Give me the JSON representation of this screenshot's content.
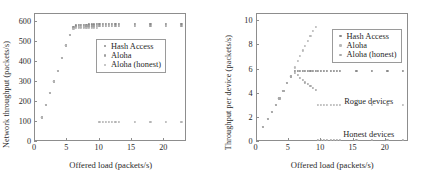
{
  "figure": {
    "panels": [
      {
        "id": "left",
        "xlabel": "Offered load (packets/s)",
        "ylabel": "Network throughput (packets/s)",
        "xticks": [
          "0",
          "5",
          "10",
          "15",
          "20"
        ],
        "yticks": [
          "0",
          "100",
          "200",
          "300",
          "400",
          "500",
          "600"
        ],
        "legend": [
          "Hash Access",
          "Aloha",
          "Aloha (honest)"
        ],
        "annotations": []
      },
      {
        "id": "right",
        "xlabel": "Offered load (packets/s)",
        "ylabel": "Throughput per device (packets/s)",
        "xticks": [
          "0",
          "5",
          "10",
          "15",
          "20"
        ],
        "yticks": [
          "0",
          "2",
          "4",
          "6",
          "8",
          "10"
        ],
        "legend": [
          "Hash Access",
          "Aloha",
          "Aloha (honest)"
        ],
        "annotations": [
          "Rogue devices",
          "Honest devices"
        ]
      }
    ]
  },
  "colors": {
    "hash_access": "#8a8a8a",
    "aloha": "#9e9e9e",
    "aloha_honest": "#b4b4b4",
    "axis": "#8d8d8d",
    "text": "#2a2a2a"
  },
  "chart_data": [
    {
      "type": "scatter",
      "id": "left",
      "title": "",
      "xlabel": "Offered load (packets/s)",
      "ylabel": "Network throughput (packets/s)",
      "xlim": [
        0,
        23.5
      ],
      "ylim": [
        0,
        640
      ],
      "xticks": [
        0,
        5,
        10,
        15,
        20
      ],
      "yticks": [
        0,
        100,
        200,
        300,
        400,
        500,
        600
      ],
      "grid": false,
      "legend_position": "center-right",
      "series": [
        {
          "name": "Hash Access",
          "marker": "dot",
          "color": "#8a8a8a",
          "x": [
            1.2,
            1.9,
            2.5,
            3.1,
            3.7,
            4.3,
            4.9,
            5.5,
            6.1,
            6.5,
            6.9,
            7.3,
            7.7,
            8.1,
            8.5,
            8.9,
            9.3,
            9.7,
            10.1,
            10.6,
            11.1,
            11.6,
            12.1,
            12.6,
            13.1,
            15.6,
            18.0,
            20.4,
            22.8
          ],
          "y": [
            118,
            182,
            240,
            298,
            352,
            415,
            478,
            532,
            572,
            578,
            580,
            581,
            582,
            582,
            583,
            583,
            583,
            584,
            584,
            584,
            584,
            585,
            585,
            585,
            585,
            585,
            585,
            585,
            585
          ]
        },
        {
          "name": "Aloha",
          "marker": "dot",
          "color": "#9e9e9e",
          "x": [
            1.2,
            1.9,
            2.5,
            3.1,
            3.7,
            4.3,
            4.9,
            5.5,
            6.1,
            6.5,
            6.9,
            7.3,
            7.7,
            8.1,
            8.5,
            8.9,
            9.3,
            9.7,
            10.1,
            10.6,
            11.1,
            11.6,
            12.1,
            12.6,
            13.1,
            15.6,
            18.0,
            20.4,
            22.8
          ],
          "y": [
            118,
            182,
            240,
            298,
            352,
            415,
            478,
            532,
            566,
            570,
            572,
            572,
            572,
            573,
            573,
            573,
            573,
            574,
            574,
            574,
            574,
            574,
            574,
            574,
            574,
            574,
            574,
            574,
            574
          ]
        },
        {
          "name": "Aloha (honest)",
          "marker": "dot",
          "color": "#b4b4b4",
          "x": [
            1.2,
            1.9,
            2.5,
            3.1,
            3.7,
            4.3,
            4.9,
            5.5,
            6.1,
            6.5,
            6.9,
            7.3,
            7.7,
            8.1,
            8.5,
            8.9,
            9.3,
            9.7,
            10.1,
            10.6,
            11.1,
            11.6,
            12.1,
            12.6,
            13.1,
            15.6,
            18.0,
            20.4,
            22.8
          ],
          "y": [
            118,
            182,
            240,
            298,
            352,
            415,
            478,
            532,
            560,
            564,
            566,
            566,
            566,
            566,
            567,
            567,
            567,
            567,
            97,
            97,
            97,
            97,
            97,
            97,
            97,
            97,
            97,
            97,
            97
          ]
        }
      ]
    },
    {
      "type": "scatter",
      "id": "right",
      "title": "",
      "xlabel": "Offered load (packets/s)",
      "ylabel": "Throughput per device (packets/s)",
      "xlim": [
        0,
        23.5
      ],
      "ylim": [
        0,
        10.6
      ],
      "xticks": [
        0,
        5,
        10,
        15,
        20
      ],
      "yticks": [
        0,
        2,
        4,
        6,
        8,
        10
      ],
      "grid": false,
      "legend_position": "upper-right",
      "annotations": [
        {
          "text": "Rogue devices",
          "x": 17.5,
          "y": 3.35
        },
        {
          "text": "Honest devices",
          "x": 17.5,
          "y": 0.55
        }
      ],
      "series": [
        {
          "name": "Hash Access",
          "marker": "dot",
          "color": "#8a8a8a",
          "x": [
            1.2,
            1.9,
            2.5,
            3.1,
            3.7,
            4.3,
            4.9,
            5.5,
            6.1,
            6.5,
            6.9,
            7.3,
            7.7,
            8.1,
            8.5,
            8.9,
            9.3,
            9.7,
            10.1,
            10.6,
            11.1,
            11.6,
            12.1,
            12.6,
            13.1,
            15.6,
            18.0,
            20.4,
            22.8
          ],
          "y": [
            1.18,
            1.82,
            2.4,
            2.98,
            3.52,
            4.15,
            4.78,
            5.35,
            5.78,
            5.8,
            5.8,
            5.8,
            5.8,
            5.8,
            5.8,
            5.8,
            5.8,
            5.8,
            5.8,
            5.8,
            5.8,
            5.8,
            5.8,
            5.8,
            5.8,
            5.8,
            5.8,
            5.8,
            5.8
          ]
        },
        {
          "name": "Aloha",
          "marker": "dot",
          "color": "#b8b8b8",
          "x": [
            1.2,
            1.9,
            2.5,
            3.1,
            3.7,
            4.3,
            4.9,
            5.5,
            6.1,
            6.5,
            6.9,
            7.3,
            7.7,
            8.1,
            8.5,
            8.9,
            9.3,
            9.7,
            10.1,
            10.6,
            11.1,
            11.6,
            12.1,
            12.6,
            13.1,
            15.6,
            18.0,
            20.4,
            22.8
          ],
          "y": [
            1.18,
            1.82,
            2.4,
            2.98,
            3.52,
            4.15,
            4.78,
            5.4,
            6.1,
            6.6,
            7.05,
            7.5,
            7.9,
            8.3,
            8.7,
            9.1,
            9.45,
            3.02,
            3.02,
            3.02,
            3.02,
            3.02,
            3.02,
            3.02,
            3.02,
            3.02,
            3.02,
            3.02,
            3.02
          ]
        },
        {
          "name": "Aloha (honest)",
          "marker": "dot",
          "color": "#a8a8a8",
          "x": [
            1.2,
            1.9,
            2.5,
            3.1,
            3.7,
            4.3,
            4.9,
            5.5,
            6.1,
            6.5,
            6.9,
            7.3,
            7.7,
            8.1,
            8.5,
            8.9,
            9.3,
            9.7,
            10.1,
            10.6,
            11.1,
            11.6,
            12.1,
            12.6,
            13.1,
            15.6,
            18.0,
            20.4,
            22.8
          ],
          "y": [
            1.18,
            1.82,
            2.4,
            2.98,
            3.52,
            4.15,
            4.78,
            5.35,
            5.65,
            5.45,
            5.25,
            5.05,
            4.85,
            4.7,
            4.55,
            4.4,
            4.25,
            0.05,
            0.05,
            0.05,
            0.05,
            0.05,
            0.05,
            0.05,
            0.05,
            0.05,
            0.05,
            0.05,
            0.05
          ]
        }
      ]
    }
  ]
}
